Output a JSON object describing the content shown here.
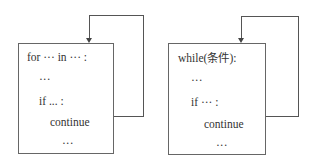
{
  "diagrams": [
    {
      "name": "for-loop-continue",
      "lines": [
        "for ··· in ··· :",
        "···",
        "if ... :",
        "continue",
        "···"
      ]
    },
    {
      "name": "while-loop-continue",
      "lines": [
        "while(条件):",
        "···",
        "if ··· :",
        "continue",
        "···"
      ]
    }
  ],
  "colors": {
    "stroke": "#555555",
    "text": "#333333"
  }
}
